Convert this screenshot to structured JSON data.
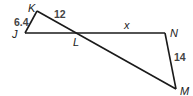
{
  "diagram": {
    "type": "geometry-figure",
    "points": {
      "K": {
        "label": "K",
        "x": 37,
        "y": 11
      },
      "J": {
        "label": "J",
        "x": 25,
        "y": 33
      },
      "L": {
        "label": "L",
        "x": 78,
        "y": 33
      },
      "N": {
        "label": "N",
        "x": 165,
        "y": 33
      },
      "M": {
        "label": "M",
        "x": 176,
        "y": 89
      }
    },
    "segments": [
      {
        "from": "J",
        "to": "K",
        "length_label": "6.4"
      },
      {
        "from": "K",
        "to": "L",
        "length_label": "12"
      },
      {
        "from": "L",
        "to": "N",
        "length_label": "x"
      },
      {
        "from": "N",
        "to": "M",
        "length_label": "14"
      },
      {
        "from": "J",
        "to": "N",
        "length_label": ""
      },
      {
        "from": "K",
        "to": "M",
        "length_label": ""
      }
    ],
    "labels": {
      "K": "K",
      "J": "J",
      "L": "L",
      "N": "N",
      "M": "M",
      "JK": "6.4",
      "KL": "12",
      "LN": "x",
      "NM": "14"
    },
    "line_color": "#1a1a1a"
  }
}
